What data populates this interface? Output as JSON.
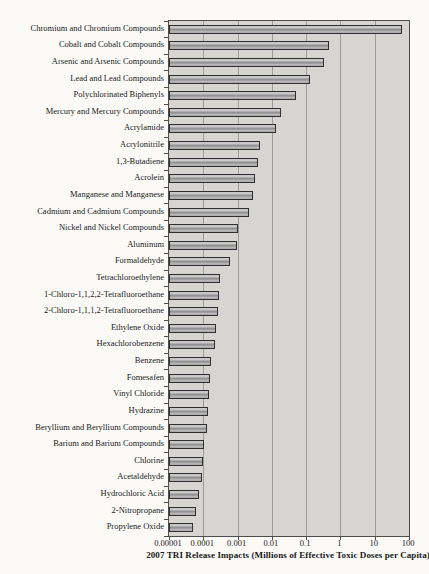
{
  "chart_data": {
    "type": "bar",
    "orientation": "horizontal",
    "xscale": "log",
    "xlim": [
      1e-05,
      100
    ],
    "n_decades": 7,
    "grid": "vertical gridlines at each decade",
    "legend": "none",
    "title": "",
    "xlabel": "2007 TRI Release Impacts (Millions of Effective Toxic Doses per Capita)",
    "ylabel": "",
    "xticks": [
      "0.00001",
      "0.0001",
      "0.001",
      "0.01",
      "0.1",
      "1",
      "10",
      "100"
    ],
    "categories": [
      "Chromium and Chromium Compounds",
      "Cobalt and Cobalt Compounds",
      "Arsenic and Arsenic Compounds",
      "Lead and Lead Compounds",
      "Polychlorinated Biphenyls",
      "Mercury and Mercury Compounds",
      "Acrylamide",
      "Acrylonitrile",
      "1,3-Butadiene",
      "Acrolein",
      "Manganese and Manganese",
      "Cadmium and Cadmium Compounds",
      "Nickel and Nickel Compounds",
      "Aluminum",
      "Formaldehyde",
      "Tetrachloroethylene",
      "1-Chloro-1,1,2,2-Tetrafluoroethane",
      "2-Chloro-1,1,1,2-Tetrafluoroethane",
      "Ethylene Oxide",
      "Hexachlorobenzene",
      "Benzene",
      "Fomesafen",
      "Vinyl Chloride",
      "Hydrazine",
      "Beryllium and Beryllium Compounds",
      "Barium and Barium Compounds",
      "Chlorine",
      "Acetaldehyde",
      "Hydrochloric Acid",
      "2-Nitropropane",
      "Propylene Oxide"
    ],
    "values": [
      62,
      0.45,
      0.32,
      0.13,
      0.05,
      0.018,
      0.0135,
      0.0045,
      0.004,
      0.0032,
      0.0028,
      0.0021,
      0.00105,
      0.00097,
      0.0006,
      0.0003,
      0.00028,
      0.000265,
      0.00023,
      0.000215,
      0.000163,
      0.00016,
      0.000145,
      0.000139,
      0.000124,
      0.000104,
      0.0001,
      8.9e-05,
      7.4e-05,
      6.3e-05,
      5e-05
    ],
    "colors": {
      "page_bg": "#fbfaf7",
      "plot_bg": "#d6d5d1",
      "gridline": "#9c9c9c",
      "frame": "#4d4d4d",
      "bar_fill_light": "#c8c8c8",
      "bar_fill_dark": "#8e8e8e",
      "bar_border": "#2e2e2e",
      "text": "#1a1a1a"
    }
  }
}
